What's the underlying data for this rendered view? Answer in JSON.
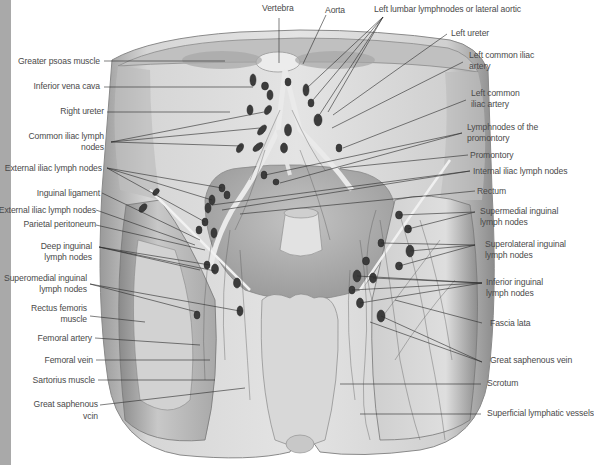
{
  "figure": {
    "colors": {
      "left_strip": "#a9a9a9",
      "label_text": "#4a4a4a",
      "leader_line": "#2a2a2a",
      "lymph_node": "#3a3a3a",
      "tissue_light": "#d9d9d9",
      "tissue_mid": "#b5b5b5",
      "tissue_dark": "#8a8a8a"
    }
  },
  "labels": {
    "top": [
      {
        "id": "vertebra",
        "text": "Vertebra"
      },
      {
        "id": "aorta",
        "text": "Aorta"
      },
      {
        "id": "left_lumbar",
        "text": "Left lumbar lymphnodes or lateral aortic"
      }
    ],
    "left": [
      {
        "id": "greater_psoas",
        "text": "Greater psoas muscle"
      },
      {
        "id": "inferior_vena_cava",
        "text": "Inferior vena cava"
      },
      {
        "id": "right_ureter",
        "text": "Right ureter"
      },
      {
        "id": "common_iliac_nodes_1",
        "text": "Common iliac lymph"
      },
      {
        "id": "common_iliac_nodes_2",
        "text": "nodes"
      },
      {
        "id": "external_iliac_nodes_a",
        "text": "External iliac lymph nodes"
      },
      {
        "id": "inguinal_ligament",
        "text": "Inguinal ligament"
      },
      {
        "id": "external_iliac_nodes_b",
        "text": "External iliac lymph nodes"
      },
      {
        "id": "parietal_peritoneum",
        "text": "Parietal peritoneum"
      },
      {
        "id": "deep_inguinal_1",
        "text": "Deep inguinal"
      },
      {
        "id": "deep_inguinal_2",
        "text": "lymph nodes"
      },
      {
        "id": "superomedial_left_1",
        "text": "Superomedial inguinal"
      },
      {
        "id": "superomedial_left_2",
        "text": "lymph nodes"
      },
      {
        "id": "rectus_femoris_1",
        "text": "Rectus femoris"
      },
      {
        "id": "rectus_femoris_2",
        "text": "muscle"
      },
      {
        "id": "femoral_artery",
        "text": "Femoral artery"
      },
      {
        "id": "femoral_vein",
        "text": "Femoral vein"
      },
      {
        "id": "sartorius",
        "text": "Sartorius muscle"
      },
      {
        "id": "great_saphenous_left_1",
        "text": "Great saphenous"
      },
      {
        "id": "great_saphenous_left_2",
        "text": "vcin"
      }
    ],
    "right": [
      {
        "id": "left_ureter",
        "text": "Left ureter"
      },
      {
        "id": "left_common_iliac_artery_a1",
        "text": "Left common iliac"
      },
      {
        "id": "left_common_iliac_artery_a2",
        "text": "artery"
      },
      {
        "id": "left_common_iliac_artery_b1",
        "text": "Left common"
      },
      {
        "id": "left_common_iliac_artery_b2",
        "text": "iliac artery"
      },
      {
        "id": "promontory_nodes_1",
        "text": "Lymphnodes of the"
      },
      {
        "id": "promontory_nodes_2",
        "text": "promontory"
      },
      {
        "id": "promontory",
        "text": "Promontory"
      },
      {
        "id": "internal_iliac_nodes",
        "text": "Internal iliac lymph nodes"
      },
      {
        "id": "rectum",
        "text": "Rectum"
      },
      {
        "id": "supermedial_inguinal_1",
        "text": "Supermedial inguinal"
      },
      {
        "id": "supermedial_inguinal_2",
        "text": "lymph nodes"
      },
      {
        "id": "superolateral_inguinal_1",
        "text": "Superolateral inguinal"
      },
      {
        "id": "superolateral_inguinal_2",
        "text": "lymph nodes"
      },
      {
        "id": "inferior_inguinal_1",
        "text": "Inferior inguinal"
      },
      {
        "id": "inferior_inguinal_2",
        "text": "lymph nodes"
      },
      {
        "id": "fascia_lata",
        "text": "Fascia lata"
      },
      {
        "id": "great_saphenous_right",
        "text": "Great saphenous vein"
      },
      {
        "id": "scrotum",
        "text": "Scrotum"
      },
      {
        "id": "superficial_lymphatic",
        "text": "Superficial lymphatic vessels"
      }
    ]
  }
}
